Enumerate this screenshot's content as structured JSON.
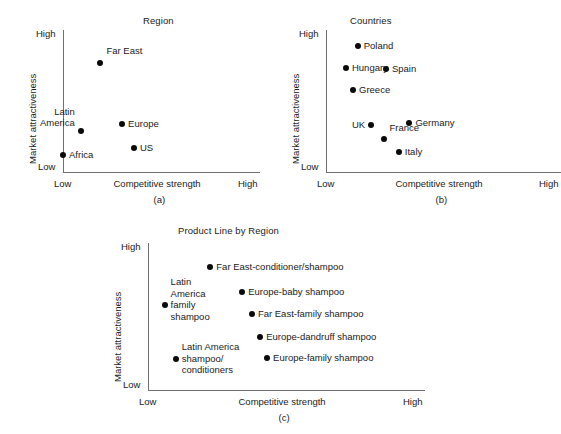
{
  "figure": {
    "panels": [
      {
        "id": "a",
        "caption": "(a)",
        "title": "Region",
        "axis": {
          "ylabel": "Market attractiveness",
          "xlabel": "Competitive strength",
          "y_high": "High",
          "y_low": "Low",
          "x_low": "Low",
          "x_high": "High"
        },
        "points": [
          {
            "label": "Far East",
            "x": 0.19,
            "y": 0.77
          },
          {
            "label": "Latin\nAmerica",
            "x": 0.09,
            "y": 0.29
          },
          {
            "label": "Europe",
            "x": 0.3,
            "y": 0.34
          },
          {
            "label": "Africa",
            "x": 0.0,
            "y": 0.12
          },
          {
            "label": "US",
            "x": 0.36,
            "y": 0.17
          }
        ]
      },
      {
        "id": "b",
        "caption": "(b)",
        "title": "Countries",
        "axis": {
          "ylabel": "Market attractiveness",
          "xlabel": "Competitive strength",
          "y_high": "High",
          "y_low": "Low",
          "x_low": "Low",
          "x_high": "High"
        },
        "points": [
          {
            "label": "Poland",
            "x": 0.135,
            "y": 0.885
          },
          {
            "label": "Hungary",
            "x": 0.085,
            "y": 0.735
          },
          {
            "label": "Spain",
            "x": 0.255,
            "y": 0.725
          },
          {
            "label": "Greece",
            "x": 0.115,
            "y": 0.58
          },
          {
            "label": "UK",
            "x": 0.192,
            "y": 0.33
          },
          {
            "label": "France",
            "x": 0.245,
            "y": 0.235
          },
          {
            "label": "Germany",
            "x": 0.355,
            "y": 0.345
          },
          {
            "label": "Italy",
            "x": 0.31,
            "y": 0.14
          }
        ]
      },
      {
        "id": "c",
        "caption": "(c)",
        "title": "Product Line by Region",
        "axis": {
          "ylabel": "Market attractiveness",
          "xlabel": "Competitive strength",
          "y_high": "High",
          "y_low": "Low",
          "x_low": "Low",
          "x_high": "High"
        },
        "points": [
          {
            "label": "Far East-conditioner/shampoo",
            "x": 0.225,
            "y": 0.835
          },
          {
            "label": "Europe-baby shampoo",
            "x": 0.34,
            "y": 0.665
          },
          {
            "label": "Latin\nAmerica\nfamily\nshampoo",
            "x": 0.06,
            "y": 0.575
          },
          {
            "label": "Far East-family shampoo",
            "x": 0.375,
            "y": 0.52
          },
          {
            "label": "Europe-dandruff shampoo",
            "x": 0.405,
            "y": 0.36
          },
          {
            "label": "Europe-family shampoo",
            "x": 0.43,
            "y": 0.215
          },
          {
            "label": "Latin America\nshampoo/\nconditioners",
            "x": 0.1,
            "y": 0.21
          }
        ]
      }
    ]
  },
  "chart_data": [
    {
      "type": "scatter",
      "title": "Region",
      "xlabel": "Competitive strength",
      "ylabel": "Market attractiveness",
      "xlim": [
        "Low",
        "High"
      ],
      "ylim": [
        "Low",
        "High"
      ],
      "grid": false,
      "legend": "none",
      "caption": "(a)",
      "categories": [
        "Far East",
        "Latin America",
        "Europe",
        "Africa",
        "US"
      ],
      "points": [
        {
          "name": "Far East",
          "x": 0.19,
          "y": 0.77
        },
        {
          "name": "Latin America",
          "x": 0.09,
          "y": 0.29
        },
        {
          "name": "Europe",
          "x": 0.3,
          "y": 0.34
        },
        {
          "name": "Africa",
          "x": 0.0,
          "y": 0.12
        },
        {
          "name": "US",
          "x": 0.36,
          "y": 0.17
        }
      ]
    },
    {
      "type": "scatter",
      "title": "Countries",
      "xlabel": "Competitive strength",
      "ylabel": "Market attractiveness",
      "xlim": [
        "Low",
        "High"
      ],
      "ylim": [
        "Low",
        "High"
      ],
      "grid": false,
      "legend": "none",
      "caption": "(b)",
      "categories": [
        "Poland",
        "Hungary",
        "Spain",
        "Greece",
        "UK",
        "France",
        "Germany",
        "Italy"
      ],
      "points": [
        {
          "name": "Poland",
          "x": 0.135,
          "y": 0.885
        },
        {
          "name": "Hungary",
          "x": 0.085,
          "y": 0.735
        },
        {
          "name": "Spain",
          "x": 0.255,
          "y": 0.725
        },
        {
          "name": "Greece",
          "x": 0.115,
          "y": 0.58
        },
        {
          "name": "UK",
          "x": 0.192,
          "y": 0.33
        },
        {
          "name": "France",
          "x": 0.245,
          "y": 0.235
        },
        {
          "name": "Germany",
          "x": 0.355,
          "y": 0.345
        },
        {
          "name": "Italy",
          "x": 0.31,
          "y": 0.14
        }
      ]
    },
    {
      "type": "scatter",
      "title": "Product Line by Region",
      "xlabel": "Competitive strength",
      "ylabel": "Market attractiveness",
      "xlim": [
        "Low",
        "High"
      ],
      "ylim": [
        "Low",
        "High"
      ],
      "grid": false,
      "legend": "none",
      "caption": "(c)",
      "categories": [
        "Far East-conditioner/shampoo",
        "Europe-baby shampoo",
        "Latin America family shampoo",
        "Far East-family shampoo",
        "Europe-dandruff shampoo",
        "Europe-family shampoo",
        "Latin America shampoo/conditioners"
      ],
      "points": [
        {
          "name": "Far East-conditioner/shampoo",
          "x": 0.225,
          "y": 0.835
        },
        {
          "name": "Europe-baby shampoo",
          "x": 0.34,
          "y": 0.665
        },
        {
          "name": "Latin America family shampoo",
          "x": 0.06,
          "y": 0.575
        },
        {
          "name": "Far East-family shampoo",
          "x": 0.375,
          "y": 0.52
        },
        {
          "name": "Europe-dandruff shampoo",
          "x": 0.405,
          "y": 0.36
        },
        {
          "name": "Europe-family shampoo",
          "x": 0.43,
          "y": 0.215
        },
        {
          "name": "Latin America shampoo/conditioners",
          "x": 0.1,
          "y": 0.21
        }
      ]
    }
  ]
}
